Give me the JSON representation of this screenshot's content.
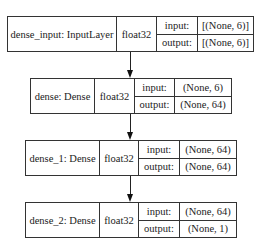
{
  "diagram": {
    "type": "keras-model-plot",
    "nodes": [
      {
        "name": "dense_input: InputLayer",
        "dtype": "float32",
        "input_label": "input:",
        "input": "[(None, 6)]",
        "output_label": "output:",
        "output": "[(None, 6)]"
      },
      {
        "name": "dense: Dense",
        "dtype": "float32",
        "input_label": "input:",
        "input": "(None, 6)",
        "output_label": "output:",
        "output": "(None, 64)"
      },
      {
        "name": "dense_1: Dense",
        "dtype": "float32",
        "input_label": "input:",
        "input": "(None, 64)",
        "output_label": "output:",
        "output": "(None, 64)"
      },
      {
        "name": "dense_2: Dense",
        "dtype": "float32",
        "input_label": "input:",
        "input": "(None, 64)",
        "output_label": "output:",
        "output": "(None, 1)"
      }
    ],
    "edges": [
      {
        "from": "dense_input",
        "to": "dense"
      },
      {
        "from": "dense",
        "to": "dense_1"
      },
      {
        "from": "dense_1",
        "to": "dense_2"
      }
    ]
  }
}
